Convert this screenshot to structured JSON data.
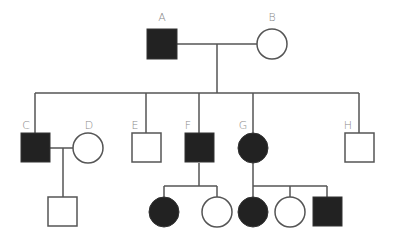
{
  "colors": {
    "affected": "#222222",
    "unaffected": "#ffffff",
    "line": "#555555",
    "label": "#8a8a8a"
  },
  "legend": {
    "square": "male",
    "circle": "female",
    "filled": "affected",
    "open": "unaffected"
  },
  "generations": [
    {
      "id": "I",
      "individuals": [
        {
          "label": "A",
          "sex": "male",
          "affected": true
        },
        {
          "label": "B",
          "sex": "female",
          "affected": false
        }
      ]
    },
    {
      "id": "II",
      "individuals": [
        {
          "label": "C",
          "sex": "male",
          "affected": true
        },
        {
          "label": "D",
          "sex": "female",
          "affected": false,
          "note": "spouse of C"
        },
        {
          "label": "E",
          "sex": "male",
          "affected": false
        },
        {
          "label": "F",
          "sex": "male",
          "affected": true
        },
        {
          "label": "G",
          "sex": "female",
          "affected": true
        },
        {
          "label": "H",
          "sex": "male",
          "affected": false
        }
      ]
    },
    {
      "id": "III",
      "individuals": [
        {
          "label": "",
          "sex": "male",
          "affected": false,
          "parents": "C x D"
        },
        {
          "label": "",
          "sex": "female",
          "affected": true,
          "parents": "F"
        },
        {
          "label": "",
          "sex": "female",
          "affected": false,
          "parents": "F"
        },
        {
          "label": "",
          "sex": "female",
          "affected": true,
          "parents": "G"
        },
        {
          "label": "",
          "sex": "female",
          "affected": false,
          "parents": "G"
        },
        {
          "label": "",
          "sex": "male",
          "affected": true,
          "parents": "G"
        }
      ]
    }
  ],
  "labels": {
    "A": "A",
    "B": "B",
    "C": "C",
    "D": "D",
    "E": "E",
    "F": "F",
    "G": "G",
    "H": "H"
  }
}
